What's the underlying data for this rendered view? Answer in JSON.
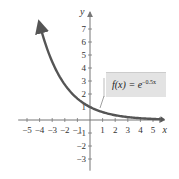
{
  "chart_data": {
    "type": "line",
    "title": "",
    "xlabel": "x",
    "ylabel": "y",
    "xlim": [
      -5.5,
      5.8
    ],
    "ylim": [
      -3.5,
      8
    ],
    "x_ticks": [
      -5,
      -4,
      -3,
      -2,
      -1,
      1,
      2,
      3,
      4,
      5
    ],
    "y_ticks": [
      -3,
      -2,
      -1,
      1,
      2,
      3,
      4,
      5,
      6,
      7
    ],
    "grid": false,
    "series": [
      {
        "name": "f(x) = e^(-0.5x)",
        "function": "e^(-0.5x)",
        "x": [
          -4,
          -3,
          -2,
          -1,
          0,
          1,
          2,
          3,
          4,
          5,
          5.6
        ],
        "values": [
          7.39,
          4.48,
          2.72,
          1.65,
          1.0,
          0.61,
          0.37,
          0.22,
          0.14,
          0.08,
          0.06
        ],
        "color": "#555555"
      }
    ],
    "legend": {
      "label_prefix": "f(x) = e",
      "label_exponent": "−0.5x",
      "position": "right, above curve"
    },
    "colors": {
      "curve": "#555555",
      "axes": "#888888",
      "legend_bg": "#e3e3e3"
    }
  }
}
